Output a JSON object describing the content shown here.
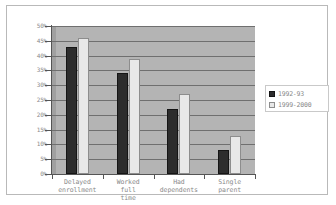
{
  "chart_data": {
    "type": "bar",
    "title": "",
    "subtitle": "",
    "xlabel": "",
    "ylabel": "",
    "ylim": [
      0,
      50
    ],
    "ytick_labels": [
      "50%",
      "45%",
      "40%",
      "35%",
      "30%",
      "25%",
      "20%",
      "15%",
      "10%",
      "5%",
      "0%"
    ],
    "ytick_values": [
      50,
      45,
      40,
      35,
      30,
      25,
      20,
      15,
      10,
      5,
      0
    ],
    "grid": true,
    "legend_position": "right",
    "categories": [
      "Delayed enrollment",
      "Worked full time",
      "Had dependents",
      "Single parent"
    ],
    "series": [
      {
        "name": "1992-93",
        "color": "#2d2d2d",
        "values": [
          43,
          34,
          22,
          8
        ]
      },
      {
        "name": "1999-2000",
        "color": "#e8e8e8",
        "values": [
          46,
          39,
          27,
          13
        ]
      }
    ]
  },
  "axis": {
    "y_unit": "percent"
  },
  "legend": {
    "entries": [
      {
        "swatch": "black-square",
        "label": "1992-93"
      },
      {
        "swatch": "white-square",
        "label": "1999-2000"
      }
    ]
  },
  "colors": {
    "plot_background": "#b4b4b4",
    "gridline": "#6f6f6f",
    "axis": "#555555",
    "tick_text": "#8a8a8a",
    "frame": "#b9b9b9",
    "page_background": "#ffffff"
  }
}
